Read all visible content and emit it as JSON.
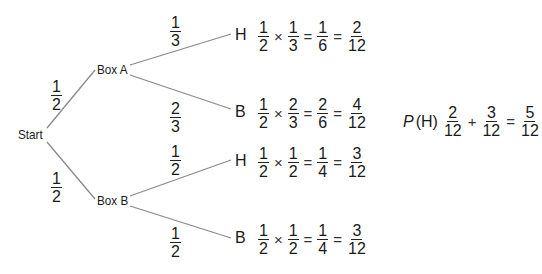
{
  "colors": {
    "line": "#8a8a8a",
    "text": "#1a1a1a"
  },
  "nodes": {
    "start": "Start",
    "box_a": "Box A",
    "box_b": "Box B",
    "a_h": "H",
    "a_b": "B",
    "b_h": "H",
    "b_b": "B"
  },
  "branches": {
    "start_a": {
      "num": "1",
      "den": "2"
    },
    "start_b": {
      "num": "1",
      "den": "2"
    },
    "a_h": {
      "num": "1",
      "den": "3"
    },
    "a_b": {
      "num": "2",
      "den": "3"
    },
    "b_h": {
      "num": "1",
      "den": "2"
    },
    "b_b": {
      "num": "1",
      "den": "2"
    }
  },
  "equations": [
    {
      "f1": {
        "num": "1",
        "den": "2"
      },
      "op": "×",
      "f2": {
        "num": "1",
        "den": "3"
      },
      "eq1": "=",
      "f3": {
        "num": "1",
        "den": "6"
      },
      "eq2": "=",
      "f4": {
        "num": "2",
        "den": "12"
      }
    },
    {
      "f1": {
        "num": "1",
        "den": "2"
      },
      "op": "×",
      "f2": {
        "num": "2",
        "den": "3"
      },
      "eq1": "=",
      "f3": {
        "num": "2",
        "den": "6"
      },
      "eq2": "=",
      "f4": {
        "num": "4",
        "den": "12"
      }
    },
    {
      "f1": {
        "num": "1",
        "den": "2"
      },
      "op": "×",
      "f2": {
        "num": "1",
        "den": "2"
      },
      "eq1": "=",
      "f3": {
        "num": "1",
        "den": "4"
      },
      "eq2": "=",
      "f4": {
        "num": "3",
        "den": "12"
      }
    },
    {
      "f1": {
        "num": "1",
        "den": "2"
      },
      "op": "×",
      "f2": {
        "num": "1",
        "den": "2"
      },
      "eq1": "=",
      "f3": {
        "num": "1",
        "den": "4"
      },
      "eq2": "=",
      "f4": {
        "num": "3",
        "den": "12"
      }
    }
  ],
  "total": {
    "label_p": "P",
    "label_event": "(H)",
    "f1": {
      "num": "2",
      "den": "12"
    },
    "op": "+",
    "f2": {
      "num": "3",
      "den": "12"
    },
    "eq": "=",
    "result": {
      "num": "5",
      "den": "12"
    }
  }
}
